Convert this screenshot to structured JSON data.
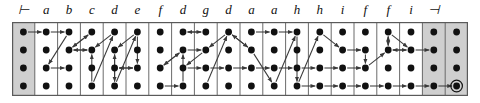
{
  "figure": {
    "type": "parse-lattice",
    "columns": 20,
    "rows": 4,
    "colors": {
      "background": "#ffffff",
      "shaded_cell": "#cfcfcf",
      "grid_line": "#5a5a5a",
      "node": "#111111",
      "arrow": "#3a3a3a",
      "label": "#111111"
    }
  },
  "geometry": {
    "grid_x": 12,
    "grid_y": 22,
    "grid_w": 456,
    "grid_h": 74,
    "col_w": 22.8,
    "row_ys": [
      10,
      28,
      46,
      64
    ],
    "node_r": 3.4
  },
  "header": {
    "labels": [
      "⊢",
      "a",
      "b",
      "c",
      "d",
      "e",
      "f",
      "d",
      "g",
      "d",
      "a",
      "a",
      "h",
      "h",
      "i",
      "f",
      "f",
      "i",
      "⊣",
      ""
    ]
  },
  "columns": [
    {
      "index": 0,
      "label": "⊢",
      "shaded": true,
      "kind": "left-endmarker"
    },
    {
      "index": 1,
      "label": "a",
      "shaded": false,
      "kind": "symbol"
    },
    {
      "index": 2,
      "label": "b",
      "shaded": false,
      "kind": "symbol"
    },
    {
      "index": 3,
      "label": "c",
      "shaded": false,
      "kind": "symbol"
    },
    {
      "index": 4,
      "label": "d",
      "shaded": false,
      "kind": "symbol"
    },
    {
      "index": 5,
      "label": "e",
      "shaded": false,
      "kind": "symbol"
    },
    {
      "index": 6,
      "label": "f",
      "shaded": false,
      "kind": "symbol"
    },
    {
      "index": 7,
      "label": "d",
      "shaded": false,
      "kind": "symbol"
    },
    {
      "index": 8,
      "label": "g",
      "shaded": false,
      "kind": "symbol"
    },
    {
      "index": 9,
      "label": "d",
      "shaded": false,
      "kind": "symbol"
    },
    {
      "index": 10,
      "label": "a",
      "shaded": false,
      "kind": "symbol"
    },
    {
      "index": 11,
      "label": "a",
      "shaded": false,
      "kind": "symbol"
    },
    {
      "index": 12,
      "label": "h",
      "shaded": false,
      "kind": "symbol"
    },
    {
      "index": 13,
      "label": "h",
      "shaded": false,
      "kind": "symbol"
    },
    {
      "index": 14,
      "label": "i",
      "shaded": false,
      "kind": "symbol"
    },
    {
      "index": 15,
      "label": "f",
      "shaded": false,
      "kind": "symbol"
    },
    {
      "index": 16,
      "label": "f",
      "shaded": false,
      "kind": "symbol"
    },
    {
      "index": 17,
      "label": "i",
      "shaded": false,
      "kind": "symbol"
    },
    {
      "index": 18,
      "label": "⊣",
      "shaded": true,
      "kind": "right-endmarker"
    },
    {
      "index": 19,
      "label": "",
      "shaded": true,
      "kind": "right-endmarker-pad"
    }
  ],
  "accepting_node": {
    "col": 19,
    "row": 3,
    "marker": "double-circle"
  },
  "edges": [
    {
      "from": [
        0,
        0
      ],
      "to": [
        1,
        0
      ]
    },
    {
      "from": [
        1,
        0
      ],
      "to": [
        2,
        0
      ]
    },
    {
      "from": [
        2,
        0
      ],
      "to": [
        1,
        2
      ]
    },
    {
      "from": [
        1,
        2
      ],
      "to": [
        2,
        2
      ]
    },
    {
      "from": [
        2,
        1
      ],
      "to": [
        3,
        0
      ]
    },
    {
      "from": [
        3,
        0
      ],
      "to": [
        2,
        1
      ]
    },
    {
      "from": [
        2,
        1
      ],
      "to": [
        3,
        1
      ]
    },
    {
      "from": [
        3,
        1
      ],
      "to": [
        2,
        1
      ]
    },
    {
      "from": [
        3,
        3
      ],
      "to": [
        4,
        0
      ]
    },
    {
      "from": [
        3,
        3
      ],
      "to": [
        3,
        1
      ]
    },
    {
      "from": [
        4,
        0
      ],
      "to": [
        3,
        1
      ]
    },
    {
      "from": [
        4,
        3
      ],
      "to": [
        4,
        1
      ]
    },
    {
      "from": [
        4,
        1
      ],
      "to": [
        4,
        3
      ]
    },
    {
      "from": [
        4,
        3
      ],
      "to": [
        5,
        0
      ]
    },
    {
      "from": [
        5,
        0
      ],
      "to": [
        4,
        1
      ]
    },
    {
      "from": [
        4,
        2
      ],
      "to": [
        5,
        2
      ]
    },
    {
      "from": [
        5,
        2
      ],
      "to": [
        4,
        2
      ]
    },
    {
      "from": [
        5,
        0
      ],
      "to": [
        5,
        2
      ]
    },
    {
      "from": [
        6,
        3
      ],
      "to": [
        7,
        3
      ]
    },
    {
      "from": [
        6,
        2
      ],
      "to": [
        7,
        1
      ]
    },
    {
      "from": [
        7,
        1
      ],
      "to": [
        6,
        2
      ]
    },
    {
      "from": [
        7,
        0
      ],
      "to": [
        8,
        0
      ]
    },
    {
      "from": [
        8,
        0
      ],
      "to": [
        7,
        0
      ]
    },
    {
      "from": [
        7,
        3
      ],
      "to": [
        7,
        1
      ]
    },
    {
      "from": [
        7,
        1
      ],
      "to": [
        8,
        1
      ]
    },
    {
      "from": [
        8,
        1
      ],
      "to": [
        7,
        2
      ]
    },
    {
      "from": [
        7,
        2
      ],
      "to": [
        8,
        2
      ]
    },
    {
      "from": [
        8,
        3
      ],
      "to": [
        9,
        0
      ]
    },
    {
      "from": [
        9,
        0
      ],
      "to": [
        8,
        1
      ]
    },
    {
      "from": [
        8,
        2
      ],
      "to": [
        9,
        2
      ]
    },
    {
      "from": [
        9,
        2
      ],
      "to": [
        10,
        2
      ]
    },
    {
      "from": [
        9,
        0
      ],
      "to": [
        10,
        1
      ]
    },
    {
      "from": [
        10,
        1
      ],
      "to": [
        9,
        0
      ]
    },
    {
      "from": [
        10,
        0
      ],
      "to": [
        11,
        0
      ]
    },
    {
      "from": [
        11,
        0
      ],
      "to": [
        12,
        0
      ]
    },
    {
      "from": [
        10,
        1
      ],
      "to": [
        11,
        3
      ]
    },
    {
      "from": [
        11,
        3
      ],
      "to": [
        12,
        0
      ]
    },
    {
      "from": [
        10,
        2
      ],
      "to": [
        11,
        2
      ]
    },
    {
      "from": [
        11,
        2
      ],
      "to": [
        12,
        2
      ]
    },
    {
      "from": [
        12,
        0
      ],
      "to": [
        12,
        3
      ]
    },
    {
      "from": [
        12,
        3
      ],
      "to": [
        13,
        3
      ]
    },
    {
      "from": [
        13,
        3
      ],
      "to": [
        14,
        3
      ]
    },
    {
      "from": [
        12,
        3
      ],
      "to": [
        13,
        0
      ]
    },
    {
      "from": [
        13,
        0
      ],
      "to": [
        14,
        1
      ]
    },
    {
      "from": [
        14,
        1
      ],
      "to": [
        15,
        1
      ]
    },
    {
      "from": [
        12,
        2
      ],
      "to": [
        13,
        2
      ]
    },
    {
      "from": [
        13,
        2
      ],
      "to": [
        14,
        2
      ]
    },
    {
      "from": [
        14,
        2
      ],
      "to": [
        15,
        2
      ]
    },
    {
      "from": [
        15,
        1
      ],
      "to": [
        15,
        2
      ]
    },
    {
      "from": [
        15,
        2
      ],
      "to": [
        16,
        1
      ]
    },
    {
      "from": [
        16,
        1
      ],
      "to": [
        16,
        0
      ]
    },
    {
      "from": [
        16,
        0
      ],
      "to": [
        17,
        1
      ]
    },
    {
      "from": [
        17,
        1
      ],
      "to": [
        16,
        1
      ]
    },
    {
      "from": [
        16,
        0
      ],
      "to": [
        16,
        1
      ]
    },
    {
      "from": [
        14,
        3
      ],
      "to": [
        15,
        3
      ]
    },
    {
      "from": [
        15,
        3
      ],
      "to": [
        16,
        3
      ]
    },
    {
      "from": [
        16,
        3
      ],
      "to": [
        17,
        3
      ]
    },
    {
      "from": [
        17,
        3
      ],
      "to": [
        18,
        3
      ]
    },
    {
      "from": [
        18,
        3
      ],
      "to": [
        19,
        3
      ]
    },
    {
      "from": [
        16,
        1
      ],
      "to": [
        17,
        1
      ]
    },
    {
      "from": [
        17,
        1
      ],
      "to": [
        18,
        1
      ]
    }
  ]
}
